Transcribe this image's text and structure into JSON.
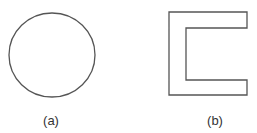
{
  "figures": [
    {
      "id": "a",
      "shape": "circle",
      "label": "(a)",
      "geometry": {
        "cx": 52,
        "cy": 55,
        "rx": 43,
        "ry": 42
      }
    },
    {
      "id": "b",
      "shape": "c-shape",
      "label": "(b)",
      "geometry": {
        "outer_left": 169,
        "outer_right": 247,
        "outer_top": 12,
        "outer_bottom": 95,
        "inner_left": 186,
        "inner_top": 28,
        "inner_bottom": 80
      }
    }
  ],
  "colors": {
    "stroke": "#555555",
    "text": "#333333",
    "background": "#ffffff"
  }
}
